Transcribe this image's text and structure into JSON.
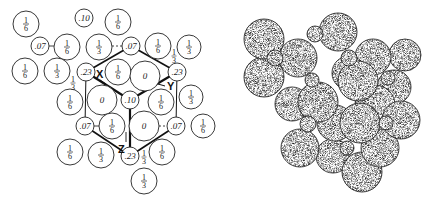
{
  "left_diagram": {
    "title": "site-occupancy-map",
    "axis_labels": {
      "x": "X",
      "y": "Y",
      "z": "Z"
    },
    "circles": [
      {
        "x": 26,
        "y": 24,
        "r": 13,
        "label": "1/6",
        "num": "1",
        "den": "6"
      },
      {
        "x": 84,
        "y": 18,
        "r": 9,
        "label": ".10"
      },
      {
        "x": 118,
        "y": 22,
        "r": 13,
        "label": "1/6",
        "num": "1",
        "den": "6"
      },
      {
        "x": 40,
        "y": 46,
        "r": 9,
        "label": ".07"
      },
      {
        "x": 67,
        "y": 47,
        "r": 13,
        "label": "1/6",
        "num": "1",
        "den": "6"
      },
      {
        "x": 99,
        "y": 47,
        "r": 13,
        "label": "1/3",
        "num": "1",
        "den": "3"
      },
      {
        "x": 131,
        "y": 46,
        "r": 9,
        "label": ".07"
      },
      {
        "x": 158,
        "y": 46,
        "r": 13,
        "label": "1/6",
        "num": "1",
        "den": "6"
      },
      {
        "x": 189,
        "y": 47,
        "r": 12,
        "label": "1/3",
        "num": "1",
        "den": "3"
      },
      {
        "x": 25,
        "y": 71,
        "r": 13,
        "label": "1/6",
        "num": "1",
        "den": "6"
      },
      {
        "x": 57,
        "y": 71,
        "r": 13,
        "label": "1/3",
        "num": "1",
        "den": "3"
      },
      {
        "x": 86,
        "y": 72,
        "r": 9,
        "label": ".23"
      },
      {
        "x": 118,
        "y": 72,
        "r": 13,
        "label": "1/6",
        "num": "1",
        "den": "6"
      },
      {
        "x": 145,
        "y": 76,
        "r": 15,
        "label": "0"
      },
      {
        "x": 177,
        "y": 72,
        "r": 9,
        "label": ".23"
      },
      {
        "x": 70,
        "y": 102,
        "r": 13,
        "label": "1/6",
        "num": "1",
        "den": "6"
      },
      {
        "x": 102,
        "y": 100,
        "r": 15,
        "label": "0"
      },
      {
        "x": 130,
        "y": 100,
        "r": 9,
        "label": ".10"
      },
      {
        "x": 161,
        "y": 102,
        "r": 13,
        "label": "1/6",
        "num": "1",
        "den": "6"
      },
      {
        "x": 191,
        "y": 97,
        "r": 12,
        "label": "1/3",
        "num": "1",
        "den": "3"
      },
      {
        "x": 85,
        "y": 126,
        "r": 9,
        "label": ".07"
      },
      {
        "x": 112,
        "y": 126,
        "r": 13,
        "label": "1/6",
        "num": "1",
        "den": "6"
      },
      {
        "x": 144,
        "y": 126,
        "r": 15,
        "label": "0"
      },
      {
        "x": 176,
        "y": 126,
        "r": 9,
        "label": ".07"
      },
      {
        "x": 203,
        "y": 126,
        "r": 12,
        "label": "1/6",
        "num": "1",
        "den": "6"
      },
      {
        "x": 70,
        "y": 152,
        "r": 13,
        "label": "1/6",
        "num": "1",
        "den": "6"
      },
      {
        "x": 101,
        "y": 155,
        "r": 13,
        "label": "1/3",
        "num": "1",
        "den": "3"
      },
      {
        "x": 130,
        "y": 156,
        "r": 9,
        "label": ".23"
      },
      {
        "x": 162,
        "y": 152,
        "r": 13,
        "label": "1/6",
        "num": "1",
        "den": "6"
      },
      {
        "x": 144,
        "y": 181,
        "r": 13,
        "label": "1/3",
        "num": "1",
        "den": "3"
      }
    ],
    "loose_fractions": [
      {
        "x": 174,
        "y": 56,
        "num": "1",
        "den": "3"
      },
      {
        "x": 73,
        "y": 83,
        "num": "1",
        "den": "3"
      },
      {
        "x": 144,
        "y": 157,
        "num": "1",
        "den": "3"
      }
    ]
  },
  "right_diagram": {
    "title": "sphere-packing-model",
    "spheres": [
      {
        "x": 264,
        "y": 39,
        "r": 20,
        "shade": 0.62
      },
      {
        "x": 264,
        "y": 77,
        "r": 20,
        "shade": 0.6
      },
      {
        "x": 298,
        "y": 58,
        "r": 19,
        "shade": 0.58
      },
      {
        "x": 338,
        "y": 32,
        "r": 19,
        "shade": 0.55
      },
      {
        "x": 315,
        "y": 34,
        "r": 8,
        "shade": 0.75
      },
      {
        "x": 275,
        "y": 58,
        "r": 8,
        "shade": 0.85
      },
      {
        "x": 373,
        "y": 57,
        "r": 18,
        "shade": 0.45
      },
      {
        "x": 405,
        "y": 55,
        "r": 16,
        "shade": 0.22
      },
      {
        "x": 349,
        "y": 73,
        "r": 17,
        "shade": 0.5
      },
      {
        "x": 394,
        "y": 87,
        "r": 17,
        "shade": 0.28
      },
      {
        "x": 401,
        "y": 120,
        "r": 19,
        "shade": 0.55
      },
      {
        "x": 292,
        "y": 104,
        "r": 17,
        "shade": 0.55
      },
      {
        "x": 375,
        "y": 105,
        "r": 20,
        "shade": 0.45
      },
      {
        "x": 300,
        "y": 148,
        "r": 19,
        "shade": 0.6
      },
      {
        "x": 333,
        "y": 156,
        "r": 17,
        "shade": 0.2
      },
      {
        "x": 362,
        "y": 172,
        "r": 20,
        "shade": 0.25
      },
      {
        "x": 380,
        "y": 148,
        "r": 19,
        "shade": 0.5
      },
      {
        "x": 335,
        "y": 123,
        "r": 18,
        "shade": 0.45
      },
      {
        "x": 318,
        "y": 102,
        "r": 20,
        "shade": 0.85
      },
      {
        "x": 358,
        "y": 81,
        "r": 20,
        "shade": 0.8
      },
      {
        "x": 360,
        "y": 123,
        "r": 20,
        "shade": 0.8
      },
      {
        "x": 349,
        "y": 58,
        "r": 8,
        "shade": 0.85
      },
      {
        "x": 308,
        "y": 124,
        "r": 8,
        "shade": 0.85
      },
      {
        "x": 386,
        "y": 123,
        "r": 7,
        "shade": 0.85
      },
      {
        "x": 388,
        "y": 78,
        "r": 7,
        "shade": 0.35
      },
      {
        "x": 347,
        "y": 148,
        "r": 7,
        "shade": 0.35
      },
      {
        "x": 312,
        "y": 80,
        "r": 7,
        "shade": 0.3
      }
    ]
  }
}
